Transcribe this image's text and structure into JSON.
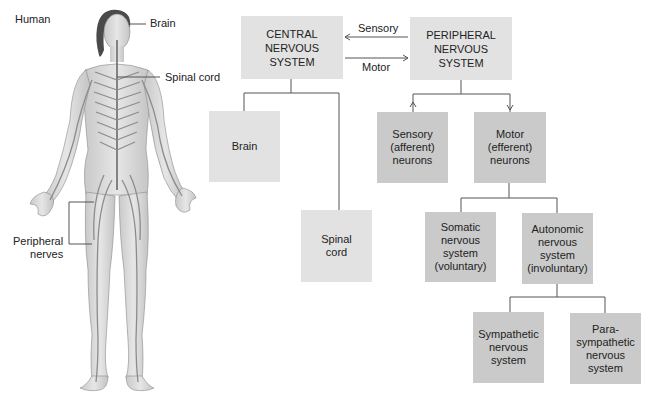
{
  "figure": {
    "species_label": "Human",
    "callouts": {
      "brain": "Brain",
      "spinal_cord": "Spinal cord",
      "peripheral_nerves_line1": "Peripheral",
      "peripheral_nerves_line2": "nerves"
    }
  },
  "diagram": {
    "cns": {
      "line1": "CENTRAL",
      "line2": "NERVOUS",
      "line3": "SYSTEM"
    },
    "pns": {
      "line1": "PERIPHERAL",
      "line2": "NERVOUS",
      "line3": "SYSTEM"
    },
    "arrows": {
      "sensory": "Sensory",
      "motor": "Motor"
    },
    "cns_children": {
      "brain": "Brain",
      "spinal_cord": {
        "line1": "Spinal",
        "line2": "cord"
      }
    },
    "pns_children": {
      "sensory": {
        "line1": "Sensory",
        "line2": "(afferent)",
        "line3": "neurons"
      },
      "motor": {
        "line1": "Motor",
        "line2": "(efferent)",
        "line3": "neurons"
      }
    },
    "motor_children": {
      "somatic": {
        "line1": "Somatic",
        "line2": "nervous",
        "line3": "system",
        "line4": "(voluntary)"
      },
      "autonomic": {
        "line1": "Autonomic",
        "line2": "nervous",
        "line3": "system",
        "line4": "(involuntary)"
      }
    },
    "autonomic_children": {
      "sympathetic": {
        "line1": "Sympathetic",
        "line2": "nervous",
        "line3": "system"
      },
      "parasympathetic": {
        "line1": "Para-",
        "line2": "sympathetic",
        "line3": "nervous",
        "line4": "system"
      }
    },
    "colors": {
      "light_box": "#e2e2e2",
      "dark_box": "#cacaca",
      "line": "#555555"
    }
  }
}
